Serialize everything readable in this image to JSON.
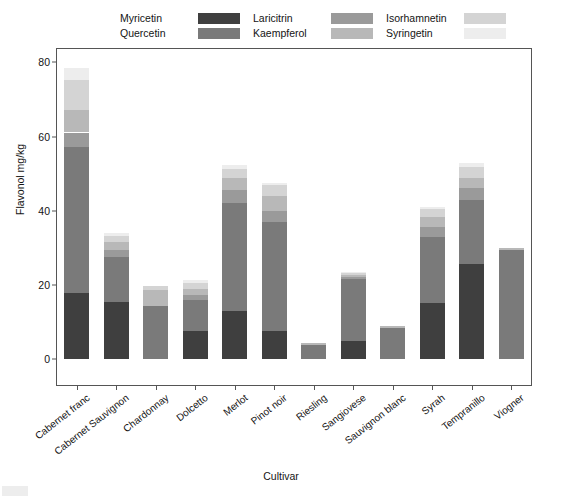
{
  "chart_data": {
    "type": "bar",
    "stacked": true,
    "title": "",
    "xlabel": "Cultivar",
    "ylabel": "Flavonol mg/kg",
    "ylim": [
      0,
      82
    ],
    "yticks": [
      0,
      20,
      40,
      60,
      80
    ],
    "ytick_labels": [
      "0",
      "20",
      "40",
      "60",
      "80"
    ],
    "grid": false,
    "legend_position": "top",
    "categories": [
      "Cabernet franc",
      "Cabernet Sauvignon",
      "Chardonnay",
      "Dolcetto",
      "Merlot",
      "Pinot noir",
      "Riesling",
      "Sangiovese",
      "Sauvignon blanc",
      "Syrah",
      "Tempranillo",
      "Viogner"
    ],
    "series": [
      {
        "name": "Myricetin",
        "color": "#3f3f3f",
        "values": [
          17.8,
          15.4,
          0.0,
          7.6,
          12.9,
          7.5,
          0.0,
          4.8,
          0.0,
          15.0,
          25.6,
          0.0
        ]
      },
      {
        "name": "Quercetin",
        "color": "#7a7a7a",
        "values": [
          39.4,
          12.2,
          14.2,
          8.2,
          29.3,
          29.4,
          3.9,
          16.8,
          8.3,
          17.9,
          17.2,
          29.5
        ]
      },
      {
        "name": "Laricitrin",
        "color": "#9a9a9a",
        "values": [
          3.9,
          1.9,
          0.0,
          1.5,
          3.4,
          3.0,
          0.0,
          0.6,
          0.0,
          2.6,
          3.4,
          0.0
        ]
      },
      {
        "name": "Kaempferol",
        "color": "#b8b8b8",
        "values": [
          6.2,
          2.0,
          4.3,
          1.6,
          3.2,
          4.1,
          0.4,
          0.4,
          0.5,
          2.9,
          2.5,
          0.4
        ]
      },
      {
        "name": "Isorhamnetin",
        "color": "#d4d4d4",
        "values": [
          8.0,
          1.7,
          1.1,
          1.5,
          2.4,
          3.0,
          0.0,
          0.5,
          0.0,
          2.0,
          3.2,
          0.0
        ]
      },
      {
        "name": "Syringetin",
        "color": "#ededed",
        "values": [
          3.1,
          0.9,
          0.0,
          0.8,
          1.0,
          0.6,
          0.0,
          0.3,
          0.0,
          0.6,
          0.9,
          0.0
        ]
      }
    ],
    "totals": [
      78.4,
      34.1,
      19.6,
      21.2,
      52.2,
      47.6,
      4.3,
      23.4,
      8.8,
      41.0,
      52.8,
      29.9
    ]
  },
  "legend": {
    "columns": [
      {
        "entries": [
          {
            "label": "Myricetin"
          },
          {
            "label": "Quercetin"
          }
        ]
      },
      {
        "entries": [
          {
            "label": "Laricitrin"
          },
          {
            "label": "Kaempferol"
          }
        ]
      },
      {
        "entries": [
          {
            "label": "Isorhamnetin"
          },
          {
            "label": "Syringetin"
          }
        ]
      }
    ]
  }
}
